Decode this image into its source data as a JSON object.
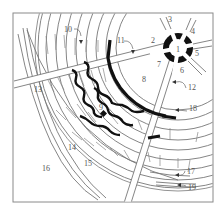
{
  "diagram": {
    "type": "schematic-radial-layout",
    "frame": {
      "x": 13,
      "y": 13,
      "width": 200,
      "height": 189,
      "stroke": "#8a8a8a"
    },
    "hub": {
      "cx": 178,
      "cy": 48,
      "label": "1"
    },
    "labels": [
      {
        "id": "1",
        "text": "1",
        "x": 176,
        "y": 52
      },
      {
        "id": "2",
        "text": "2",
        "x": 151,
        "y": 43
      },
      {
        "id": "3",
        "text": "3",
        "x": 168,
        "y": 22
      },
      {
        "id": "4",
        "text": "4",
        "x": 191,
        "y": 34
      },
      {
        "id": "5",
        "text": "5",
        "x": 195,
        "y": 56
      },
      {
        "id": "6",
        "text": "6",
        "x": 180,
        "y": 73
      },
      {
        "id": "7",
        "text": "7",
        "x": 157,
        "y": 67
      },
      {
        "id": "8",
        "text": "8",
        "x": 142,
        "y": 82
      },
      {
        "id": "9",
        "text": "9",
        "x": 99,
        "y": 110
      },
      {
        "id": "10",
        "text": "10",
        "x": 64,
        "y": 32
      },
      {
        "id": "11",
        "text": "11",
        "x": 117,
        "y": 43
      },
      {
        "id": "12",
        "text": "12",
        "x": 188,
        "y": 90
      },
      {
        "id": "13",
        "text": "13",
        "x": 34,
        "y": 92
      },
      {
        "id": "14",
        "text": "14",
        "x": 68,
        "y": 150
      },
      {
        "id": "15",
        "text": "15",
        "x": 84,
        "y": 166
      },
      {
        "id": "16",
        "text": "16",
        "x": 42,
        "y": 171
      },
      {
        "id": "17",
        "text": "17",
        "x": 187,
        "y": 174
      },
      {
        "id": "18",
        "text": "18",
        "x": 189,
        "y": 111
      },
      {
        "id": "19",
        "text": "19",
        "x": 188,
        "y": 190
      }
    ],
    "colors": {
      "line": "#777777",
      "solid": "#111111",
      "label": "#555555",
      "background": "#ffffff"
    }
  }
}
